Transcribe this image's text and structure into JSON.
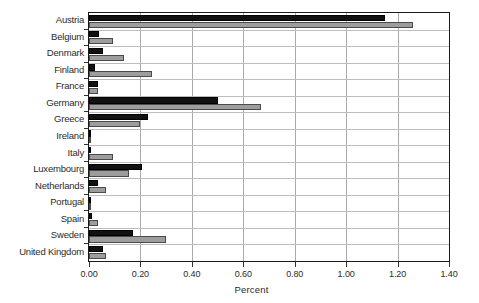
{
  "chart_data": {
    "type": "bar",
    "orientation": "horizontal",
    "title": "",
    "xlabel": "Percent",
    "ylabel": "",
    "xlim": [
      0.0,
      1.4
    ],
    "xticks": [
      "0.00",
      "0.20",
      "0.40",
      "0.60",
      "0.80",
      "1.00",
      "1.20",
      "1.40"
    ],
    "xtick_values": [
      0.0,
      0.2,
      0.4,
      0.6,
      0.8,
      1.0,
      1.2,
      1.4
    ],
    "grid": "vertical-and-horizontal",
    "legend": "none",
    "categories": [
      "Austria",
      "Belgium",
      "Denmark",
      "Finland",
      "France",
      "Germany",
      "Greece",
      "Ireland",
      "Italy",
      "Luxembourg",
      "Netherlands",
      "Portugal",
      "Spain",
      "Sweden",
      "United Kingdom"
    ],
    "series": [
      {
        "name": "black",
        "color": "#111111",
        "values": [
          1.15,
          0.04,
          0.055,
          0.025,
          0.035,
          0.5,
          0.23,
          0.005,
          0.008,
          0.205,
          0.035,
          0.004,
          0.013,
          0.17,
          0.055
        ]
      },
      {
        "name": "gray",
        "color": "#9d9d9d",
        "values": [
          1.26,
          0.095,
          0.135,
          0.245,
          0.035,
          0.67,
          0.2,
          0.005,
          0.095,
          0.155,
          0.065,
          0.004,
          0.035,
          0.3,
          0.065
        ]
      }
    ]
  },
  "axis": {
    "x_title": "Percent"
  }
}
